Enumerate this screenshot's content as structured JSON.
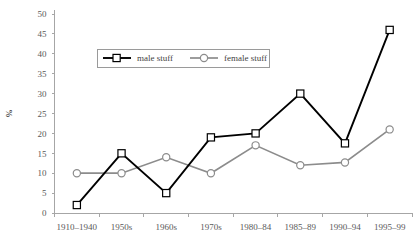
{
  "chart_data": {
    "type": "line",
    "title": "",
    "xlabel": "",
    "ylabel": "%",
    "ylim": [
      0,
      50
    ],
    "ytick_step": 5,
    "yticks": [
      "0",
      "5",
      "10",
      "15",
      "20",
      "25",
      "30",
      "35",
      "40",
      "45",
      "50"
    ],
    "grid": false,
    "legend_position": "top-center",
    "categories": [
      "1910–1940",
      "1950s",
      "1960s",
      "1970s",
      "1980–84",
      "1985–89",
      "1990–94",
      "1995–99"
    ],
    "series": [
      {
        "name": "male stuff",
        "color": "#000000",
        "marker": "open-square",
        "values": [
          2,
          15,
          5,
          19,
          20,
          30,
          17.5,
          46
        ]
      },
      {
        "name": "female stuff",
        "color": "#8c8c8c",
        "marker": "open-circle",
        "values": [
          10,
          10,
          14,
          10,
          17,
          12,
          12.7,
          21
        ]
      }
    ]
  },
  "legend": {
    "items": [
      {
        "label": "male stuff"
      },
      {
        "label": "female stuff"
      }
    ]
  },
  "colors": {
    "male": "#000000",
    "female": "#8c8c8c",
    "axis": "#a6a6a6",
    "text": "#595959",
    "background": "#ffffff"
  }
}
